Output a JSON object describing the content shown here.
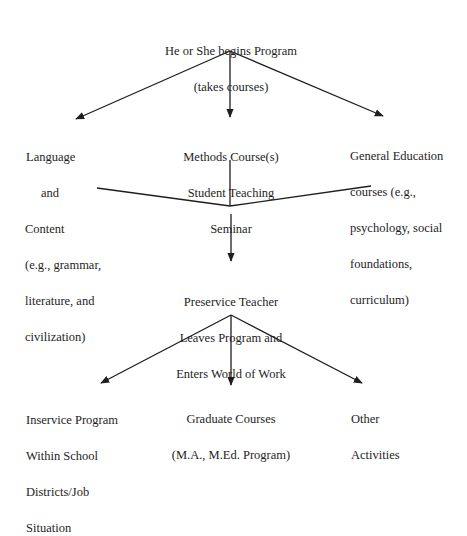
{
  "diagram": {
    "nodes": {
      "start": {
        "lines": [
          "He or She begins Program",
          "(takes courses)"
        ]
      },
      "language": {
        "lines_centered": [
          "Language",
          "and"
        ],
        "lines_left": [
          "Content",
          "(e.g., grammar,",
          "literature, and",
          "civilization)"
        ]
      },
      "methods": {
        "lines": [
          "Methods Course(s)",
          "Student Teaching",
          "Seminar"
        ]
      },
      "general": {
        "lines": [
          "General Education",
          "courses (e.g.,",
          "psychology, social",
          "foundations,",
          "curriculum)"
        ]
      },
      "preservice": {
        "lines": [
          "Preservice Teacher",
          "Leaves Program and",
          "Enters World of Work"
        ]
      },
      "inservice": {
        "lines": [
          "Inservice Program",
          "Within School",
          "Districts/Job",
          "Situation"
        ]
      },
      "graduate": {
        "lines": [
          "Graduate Courses",
          "(M.A., M.Ed. Program)"
        ]
      },
      "other": {
        "lines": [
          "Other",
          "Activities"
        ]
      }
    },
    "edges": [
      {
        "from": "start",
        "to": "language"
      },
      {
        "from": "start",
        "to": "methods"
      },
      {
        "from": "start",
        "to": "general"
      },
      {
        "from": "language",
        "to": "merge"
      },
      {
        "from": "methods",
        "to": "merge"
      },
      {
        "from": "general",
        "to": "merge"
      },
      {
        "from": "merge",
        "to": "preservice"
      },
      {
        "from": "preservice",
        "to": "inservice"
      },
      {
        "from": "preservice",
        "to": "graduate"
      },
      {
        "from": "preservice",
        "to": "other"
      }
    ],
    "line_color": "#1e1e1e"
  }
}
